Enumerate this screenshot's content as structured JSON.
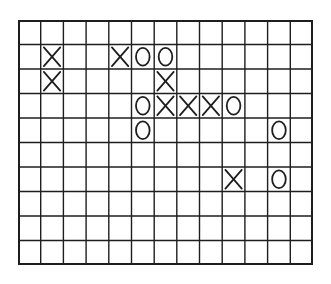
{
  "game": {
    "type": "tic-tac-toe / gomoku",
    "board": {
      "columns": 13,
      "rows": 10,
      "line_color": "#1e1e1e",
      "piece_color": "#1e1e1e"
    },
    "pieces": [
      {
        "row": 1,
        "col": 1,
        "mark": "X"
      },
      {
        "row": 1,
        "col": 4,
        "mark": "X"
      },
      {
        "row": 1,
        "col": 5,
        "mark": "O"
      },
      {
        "row": 1,
        "col": 6,
        "mark": "O"
      },
      {
        "row": 2,
        "col": 1,
        "mark": "X"
      },
      {
        "row": 2,
        "col": 6,
        "mark": "X"
      },
      {
        "row": 3,
        "col": 5,
        "mark": "O"
      },
      {
        "row": 3,
        "col": 6,
        "mark": "X"
      },
      {
        "row": 3,
        "col": 7,
        "mark": "X"
      },
      {
        "row": 3,
        "col": 8,
        "mark": "X"
      },
      {
        "row": 3,
        "col": 9,
        "mark": "O"
      },
      {
        "row": 4,
        "col": 5,
        "mark": "O"
      },
      {
        "row": 4,
        "col": 11,
        "mark": "O"
      },
      {
        "row": 6,
        "col": 9,
        "mark": "X"
      },
      {
        "row": 6,
        "col": 11,
        "mark": "O"
      }
    ]
  }
}
